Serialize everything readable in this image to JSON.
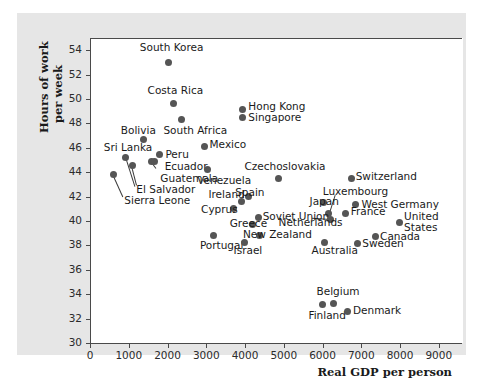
{
  "chart_data": {
    "type": "scatter",
    "title": "",
    "xlabel": "Real GDP per person",
    "ylabel_line1": "Hours of work",
    "ylabel_line2": "per week",
    "xlim": [
      0,
      9600
    ],
    "ylim": [
      30,
      55
    ],
    "xticks": [
      0,
      1000,
      2000,
      3000,
      4000,
      5000,
      6000,
      7000,
      8000,
      9000
    ],
    "yticks": [
      30,
      32,
      34,
      36,
      38,
      40,
      42,
      44,
      46,
      48,
      50,
      52,
      54
    ],
    "grid": false,
    "legend": "none",
    "marker_color": "#555555",
    "points": [
      {
        "name": "South Korea",
        "x": 2000,
        "y": 53.1,
        "lx": 1260,
        "ly": 54.3,
        "anchor": "left"
      },
      {
        "name": "Costa Rica",
        "x": 2130,
        "y": 49.7,
        "lx": 1460,
        "ly": 50.7,
        "anchor": "left"
      },
      {
        "name": "South Africa",
        "x": 2340,
        "y": 48.4,
        "lx": 1870,
        "ly": 47.5,
        "anchor": "left"
      },
      {
        "name": "Hong Kong",
        "x": 3900,
        "y": 49.2,
        "lx": 4060,
        "ly": 49.4,
        "anchor": "left"
      },
      {
        "name": "Singapore",
        "x": 3910,
        "y": 48.6,
        "lx": 4060,
        "ly": 48.5,
        "anchor": "left"
      },
      {
        "name": "Bolivia",
        "x": 1350,
        "y": 46.8,
        "lx": 770,
        "ly": 47.5,
        "anchor": "left"
      },
      {
        "name": "Mexico",
        "x": 2940,
        "y": 46.2,
        "lx": 3060,
        "ly": 46.3,
        "anchor": "left"
      },
      {
        "name": "Sri Lanka",
        "x": 900,
        "y": 45.3,
        "lx": 330,
        "ly": 46.1,
        "anchor": "left"
      },
      {
        "name": "Peru",
        "x": 1770,
        "y": 45.5,
        "lx": 1920,
        "ly": 45.5,
        "anchor": "left"
      },
      {
        "name": "Ecuador",
        "x": 1560,
        "y": 45.0,
        "lx": 1900,
        "ly": 44.5,
        "anchor": "left"
      },
      {
        "name": "Guatemala",
        "x": 1640,
        "y": 45.0,
        "lx": 1790,
        "ly": 43.5,
        "anchor": "left"
      },
      {
        "name": "El Salvador",
        "x": 1070,
        "y": 44.6,
        "lx": 1170,
        "ly": 42.6,
        "anchor": "left"
      },
      {
        "name": "Sierra Leone",
        "x": 570,
        "y": 43.9,
        "lx": 860,
        "ly": 41.7,
        "anchor": "left"
      },
      {
        "name": "Venezuela",
        "x": 3010,
        "y": 44.3,
        "lx": 2740,
        "ly": 43.4,
        "anchor": "left"
      },
      {
        "name": "Czechoslovakia",
        "x": 4830,
        "y": 43.6,
        "lx": 3960,
        "ly": 44.5,
        "anchor": "left"
      },
      {
        "name": "Switzerland",
        "x": 6710,
        "y": 43.6,
        "lx": 6830,
        "ly": 43.7,
        "anchor": "left"
      },
      {
        "name": "Ireland",
        "x": 3880,
        "y": 41.7,
        "lx": 3030,
        "ly": 42.2,
        "anchor": "left"
      },
      {
        "name": "Spain",
        "x": 4060,
        "y": 42.1,
        "lx": 3720,
        "ly": 42.4,
        "anchor": "left"
      },
      {
        "name": "Cyprus",
        "x": 3670,
        "y": 41.1,
        "lx": 2840,
        "ly": 41.0,
        "anchor": "left"
      },
      {
        "name": "Luxembourg",
        "x": 6140,
        "y": 40.7,
        "lx": 5980,
        "ly": 42.5,
        "anchor": "left"
      },
      {
        "name": "Japan",
        "x": 5990,
        "y": 41.6,
        "lx": 5640,
        "ly": 41.6,
        "anchor": "left"
      },
      {
        "name": "West Germany",
        "x": 6830,
        "y": 41.4,
        "lx": 6980,
        "ly": 41.4,
        "anchor": "left"
      },
      {
        "name": "France",
        "x": 6580,
        "y": 40.7,
        "lx": 6700,
        "ly": 40.8,
        "anchor": "left"
      },
      {
        "name": "Soviet Union",
        "x": 4310,
        "y": 40.4,
        "lx": 4430,
        "ly": 40.4,
        "anchor": "left"
      },
      {
        "name": "Greece",
        "x": 4160,
        "y": 39.8,
        "lx": 3580,
        "ly": 39.8,
        "anchor": "left"
      },
      {
        "name": "Netherlands",
        "x": 6180,
        "y": 40.2,
        "lx": 4840,
        "ly": 39.9,
        "anchor": "left"
      },
      {
        "name": "United",
        "x": 7950,
        "y": 40.0,
        "lx": 8080,
        "ly": 40.4,
        "anchor": "left"
      },
      {
        "name": "States",
        "x": null,
        "y": null,
        "lx": 8080,
        "ly": 39.5,
        "anchor": "left"
      },
      {
        "name": "New Zealand",
        "x": 4350,
        "y": 38.9,
        "lx": 3920,
        "ly": 38.9,
        "anchor": "left"
      },
      {
        "name": "Canada",
        "x": 7330,
        "y": 38.8,
        "lx": 7460,
        "ly": 38.8,
        "anchor": "left"
      },
      {
        "name": "Portugal",
        "x": 3170,
        "y": 38.9,
        "lx": 2810,
        "ly": 38.0,
        "anchor": "left"
      },
      {
        "name": "Israel",
        "x": 3960,
        "y": 38.3,
        "lx": 3680,
        "ly": 37.6,
        "anchor": "left"
      },
      {
        "name": "Australia",
        "x": 6020,
        "y": 38.3,
        "lx": 5690,
        "ly": 37.6,
        "anchor": "left"
      },
      {
        "name": "Sweden",
        "x": 6870,
        "y": 38.2,
        "lx": 7000,
        "ly": 38.2,
        "anchor": "left"
      },
      {
        "name": "Belgium",
        "x": 6250,
        "y": 33.3,
        "lx": 5820,
        "ly": 34.3,
        "anchor": "left"
      },
      {
        "name": "Finland",
        "x": 5970,
        "y": 33.2,
        "lx": 5610,
        "ly": 32.3,
        "anchor": "left"
      },
      {
        "name": "Denmark",
        "x": 6620,
        "y": 32.7,
        "lx": 6760,
        "ly": 32.7,
        "anchor": "left"
      }
    ],
    "leaders": [
      {
        "from_x": 900,
        "from_y": 45.3,
        "to_x": 1140,
        "to_y": 42.9
      },
      {
        "from_x": 570,
        "from_y": 43.9,
        "to_x": 840,
        "to_y": 42.0
      },
      {
        "from_x": 1070,
        "from_y": 44.6,
        "to_x": 1200,
        "to_y": 43.0
      },
      {
        "from_x": 1560,
        "from_y": 45.0,
        "to_x": 1700,
        "to_y": 44.4
      },
      {
        "from_x": 6140,
        "from_y": 40.7,
        "to_x": 6290,
        "to_y": 42.2
      },
      {
        "from_x": 6180,
        "from_y": 40.2,
        "to_x": 5720,
        "to_y": 40.3
      }
    ]
  }
}
